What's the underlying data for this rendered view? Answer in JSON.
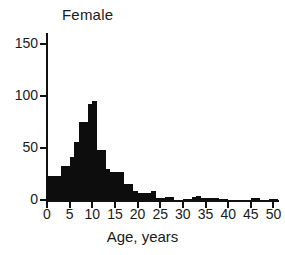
{
  "figure": {
    "title": "Female",
    "background_color": "#ffffff",
    "bar_color": "#0d0d0d",
    "axis_color": "#111111"
  },
  "chart_data": {
    "type": "bar",
    "title": "Female",
    "xlabel": "Age, years",
    "ylabel": "",
    "xlim": [
      0,
      51
    ],
    "ylim": [
      0,
      160
    ],
    "grid": false,
    "legend": false,
    "bin_width": 1,
    "xticks": [
      0,
      5,
      10,
      15,
      20,
      25,
      30,
      35,
      40,
      45,
      50
    ],
    "xticklabels": [
      "0",
      "5",
      "10",
      "15",
      "20",
      "25",
      "30",
      "35",
      "40",
      "45",
      "50"
    ],
    "yticks": [
      0,
      50,
      100,
      150
    ],
    "yticklabels": [
      "0",
      "50",
      "100",
      "150"
    ],
    "categories": [
      0,
      1,
      2,
      3,
      4,
      5,
      6,
      7,
      8,
      9,
      10,
      11,
      12,
      13,
      14,
      15,
      16,
      17,
      18,
      19,
      20,
      21,
      22,
      23,
      24,
      25,
      26,
      27,
      28,
      29,
      30,
      31,
      32,
      33,
      34,
      35,
      36,
      37,
      38,
      39,
      40,
      41,
      42,
      43,
      44,
      45,
      46,
      47,
      48,
      49,
      50
    ],
    "values": [
      23,
      23,
      23,
      33,
      33,
      41,
      56,
      75,
      75,
      93,
      95,
      48,
      48,
      30,
      27,
      27,
      27,
      15,
      15,
      9,
      7,
      7,
      7,
      9,
      2,
      2,
      3,
      3,
      0,
      0,
      1,
      1,
      3,
      4,
      2,
      2,
      2,
      2,
      1,
      1,
      0,
      0,
      0,
      0,
      0,
      2,
      2,
      0,
      0,
      1,
      1
    ]
  }
}
